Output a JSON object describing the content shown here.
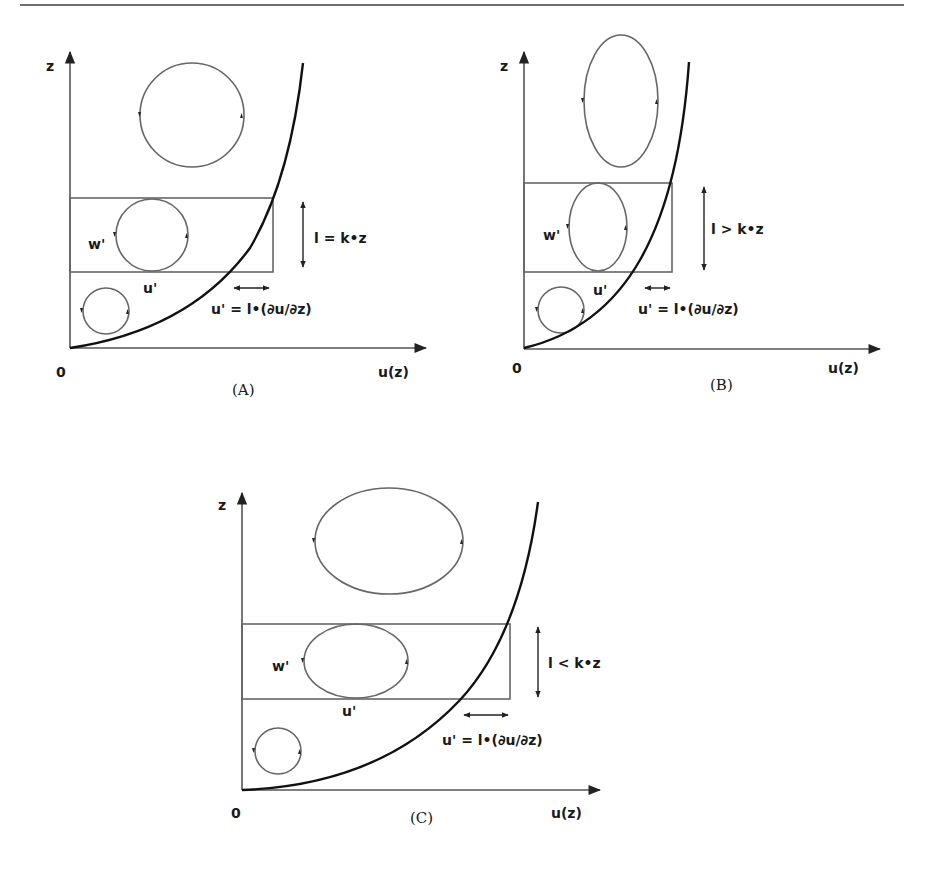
{
  "panels": [
    {
      "id": "A",
      "caption": "(A)",
      "axis_y_label": "z",
      "axis_x_label": "u(z)",
      "origin_label": "0",
      "w_label": "w'",
      "u_label": "u'",
      "length_relation": "l = k•z",
      "velocity_relation": "u' = l•(∂u/∂z)",
      "eddy_shape": "circle"
    },
    {
      "id": "B",
      "caption": "(B)",
      "axis_y_label": "z",
      "axis_x_label": "u(z)",
      "origin_label": "0",
      "w_label": "w'",
      "u_label": "u'",
      "length_relation": "l > k•z",
      "velocity_relation": "u' = l•(∂u/∂z)",
      "eddy_shape": "vertical-ellipse"
    },
    {
      "id": "C",
      "caption": "(C)",
      "axis_y_label": "z",
      "axis_x_label": "u(z)",
      "origin_label": "0",
      "w_label": "w'",
      "u_label": "u'",
      "length_relation": "l < k•z",
      "velocity_relation": "u' = l•(∂u/∂z)",
      "eddy_shape": "horizontal-ellipse"
    }
  ]
}
